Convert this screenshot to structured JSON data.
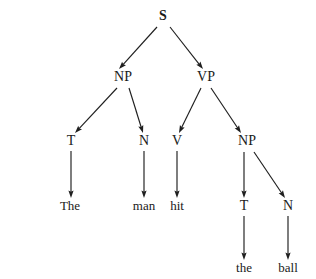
{
  "figure": {
    "kind": "syntax-tree",
    "sentence": "The man hit the ball",
    "background_color": "#ffffff",
    "ink_color": "#1f1f1f",
    "width": 316,
    "height": 279
  },
  "nodes": [
    {
      "id": "S",
      "label": "S",
      "type": "category",
      "x": 163,
      "y": 20,
      "bold": true
    },
    {
      "id": "NP1",
      "label": "NP",
      "type": "category",
      "x": 123,
      "y": 81,
      "bold": false
    },
    {
      "id": "VP",
      "label": "VP",
      "type": "category",
      "x": 206,
      "y": 81,
      "bold": false
    },
    {
      "id": "T1",
      "label": "T",
      "type": "category",
      "x": 71,
      "y": 145,
      "bold": false
    },
    {
      "id": "N1",
      "label": "N",
      "type": "category",
      "x": 144,
      "y": 145,
      "bold": false
    },
    {
      "id": "V",
      "label": "V",
      "type": "category",
      "x": 177,
      "y": 145,
      "bold": false
    },
    {
      "id": "NP2",
      "label": "NP",
      "type": "category",
      "x": 247,
      "y": 145,
      "bold": false
    },
    {
      "id": "The",
      "label": "The",
      "type": "word",
      "x": 70,
      "y": 210,
      "bold": false
    },
    {
      "id": "man",
      "label": "man",
      "type": "word",
      "x": 144,
      "y": 210,
      "bold": false
    },
    {
      "id": "hit",
      "label": "hit",
      "type": "word",
      "x": 177,
      "y": 210,
      "bold": false
    },
    {
      "id": "T2",
      "label": "T",
      "type": "category",
      "x": 244,
      "y": 210,
      "bold": false
    },
    {
      "id": "N2",
      "label": "N",
      "type": "category",
      "x": 288,
      "y": 210,
      "bold": false
    },
    {
      "id": "the",
      "label": "the",
      "type": "word",
      "x": 244,
      "y": 272,
      "bold": false
    },
    {
      "id": "ball",
      "label": "ball",
      "type": "word",
      "x": 288,
      "y": 272,
      "bold": false
    }
  ],
  "edges": [
    {
      "from": "S",
      "to": "NP1",
      "x1": 157,
      "y1": 27,
      "x2": 119,
      "y2": 69
    },
    {
      "from": "S",
      "to": "VP",
      "x1": 170,
      "y1": 27,
      "x2": 203,
      "y2": 69
    },
    {
      "from": "NP1",
      "to": "T1",
      "x1": 117,
      "y1": 88,
      "x2": 75,
      "y2": 133
    },
    {
      "from": "NP1",
      "to": "N1",
      "x1": 129,
      "y1": 88,
      "x2": 143,
      "y2": 133
    },
    {
      "from": "VP",
      "to": "V",
      "x1": 201,
      "y1": 88,
      "x2": 179,
      "y2": 133
    },
    {
      "from": "VP",
      "to": "NP2",
      "x1": 211,
      "y1": 88,
      "x2": 241,
      "y2": 133
    },
    {
      "from": "T1",
      "to": "The",
      "x1": 71,
      "y1": 151,
      "x2": 71,
      "y2": 198
    },
    {
      "from": "N1",
      "to": "man",
      "x1": 144,
      "y1": 151,
      "x2": 144,
      "y2": 198
    },
    {
      "from": "V",
      "to": "hit",
      "x1": 177,
      "y1": 151,
      "x2": 177,
      "y2": 198
    },
    {
      "from": "NP2",
      "to": "T2",
      "x1": 244,
      "y1": 152,
      "x2": 244,
      "y2": 198
    },
    {
      "from": "NP2",
      "to": "N2",
      "x1": 254,
      "y1": 152,
      "x2": 285,
      "y2": 198
    },
    {
      "from": "T2",
      "to": "the",
      "x1": 244,
      "y1": 216,
      "x2": 244,
      "y2": 260
    },
    {
      "from": "N2",
      "to": "ball",
      "x1": 288,
      "y1": 216,
      "x2": 288,
      "y2": 260
    }
  ]
}
